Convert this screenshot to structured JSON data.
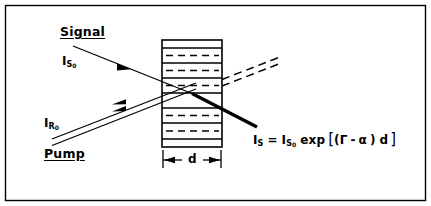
{
  "figure": {
    "kind": "optical-amplifier-schematic",
    "background_color": "#ffffff",
    "ink_color": "#000000",
    "border": {
      "present": true,
      "color": "#000000"
    }
  },
  "labels": {
    "signal": "Signal",
    "pump": "Pump",
    "signal_input_symbol": "I",
    "signal_input_sub": "S",
    "signal_input_sub2": "0",
    "pump_input_symbol": "I",
    "pump_input_sub": "R",
    "pump_input_sub2": "0",
    "thickness": "d"
  },
  "equation": {
    "lhs_symbol": "I",
    "lhs_sub": "S",
    "equals": "=",
    "rhs_symbol": "I",
    "rhs_sub": "S",
    "rhs_sub2": "0",
    "function": "exp",
    "bracket_open": "[",
    "paren_open": "(",
    "gain_symbol": "Γ",
    "minus": "-",
    "loss_symbol": "α",
    "paren_close": ")",
    "thickness_symbol": "d",
    "bracket_close": "]",
    "plain_text": "I_S = I_S0 exp [(Γ - α ) d]"
  },
  "medium": {
    "name": "periodic-layered-gain-medium",
    "solid_line_count": 8,
    "dashed_line_count": 5,
    "thickness_label": "d"
  },
  "beams": {
    "signal_in": {
      "style": "solid-single",
      "arrow": "inline-arrowhead",
      "direction": "down-right"
    },
    "signal_out": {
      "style": "solid-thick",
      "description": "amplified signal"
    },
    "pump_in": {
      "style": "solid-double",
      "arrow": "two-inline-arrowheads",
      "direction": "up-right"
    },
    "pump_out": {
      "style": "dashed-double",
      "description": "depleted pump"
    }
  }
}
